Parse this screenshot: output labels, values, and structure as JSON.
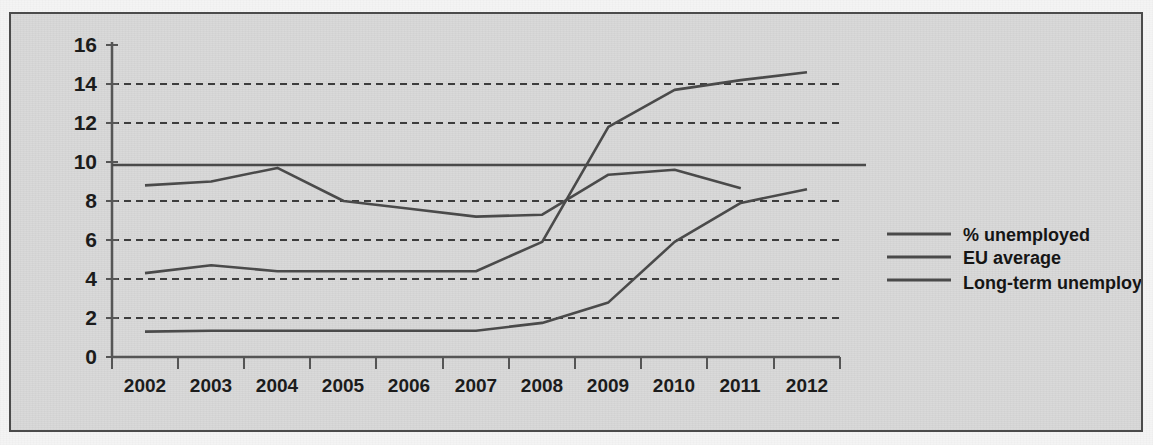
{
  "chart_data": {
    "type": "line",
    "title": "",
    "subtitle": "",
    "xlabel": "",
    "ylabel": "",
    "xlim": [
      2002,
      2012
    ],
    "ylim": [
      0,
      16
    ],
    "y_ticks": [
      0,
      2,
      4,
      6,
      8,
      10,
      12,
      14,
      16
    ],
    "grid": "horizontal-dashed",
    "legend_position": "right",
    "categories": [
      "2002",
      "2003",
      "2004",
      "2005",
      "2006",
      "2007",
      "2008",
      "2009",
      "2010",
      "2011",
      "2012"
    ],
    "series": [
      {
        "name": "% unemployed",
        "color": "#4a4a4a",
        "x": [
          "2002",
          "2003",
          "2004",
          "2005",
          "2006",
          "2007",
          "2008",
          "2009",
          "2010",
          "2011",
          "2012"
        ],
        "values": [
          4.3,
          4.7,
          4.4,
          4.4,
          4.4,
          4.4,
          5.9,
          11.8,
          13.7,
          14.2,
          14.6
        ]
      },
      {
        "name": "EU average",
        "color": "#4a4a4a",
        "x": [
          "2002",
          "2003",
          "2004",
          "2005",
          "2006",
          "2007",
          "2008",
          "2009",
          "2010",
          "2011"
        ],
        "values": [
          8.8,
          9.0,
          9.7,
          8.0,
          7.6,
          7.2,
          7.3,
          9.35,
          9.6,
          8.65
        ]
      },
      {
        "name": "EU average reference",
        "color": "#4a4a4a",
        "constant": 9.85,
        "style": "solid-horizontal"
      },
      {
        "name": "Long-term unemployed",
        "color": "#4a4a4a",
        "x": [
          "2002",
          "2003",
          "2004",
          "2005",
          "2006",
          "2007",
          "2008",
          "2009",
          "2010",
          "2011",
          "2012"
        ],
        "values": [
          1.3,
          1.35,
          1.35,
          1.35,
          1.35,
          1.35,
          1.75,
          2.8,
          5.9,
          7.9,
          8.6
        ]
      }
    ]
  },
  "axes": {
    "y_tick_labels": [
      "16",
      "14",
      "12",
      "10",
      "8",
      "6",
      "4",
      "2",
      "0"
    ],
    "x_tick_labels": [
      "2002",
      "2003",
      "2004",
      "2005",
      "2006",
      "2007",
      "2008",
      "2009",
      "2010",
      "2011",
      "2012"
    ]
  },
  "legend": {
    "items": [
      {
        "label": "% unemployed",
        "color": "#4a4a4a"
      },
      {
        "label": "EU average",
        "color": "#4a4a4a"
      },
      {
        "label": "Long-term unemployed",
        "color": "#4a4a4a"
      }
    ]
  },
  "colors": {
    "page_background": "#f4f4f4",
    "figure_background": "#d8d8d8",
    "frame_border": "#4b4b4b",
    "line": "#4a4a4a",
    "grid": "#3d3d3d",
    "text": "#1c1c1c"
  }
}
